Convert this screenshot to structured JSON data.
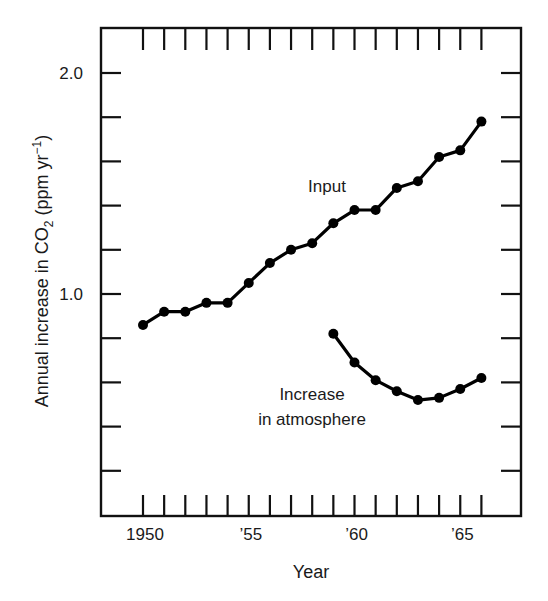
{
  "chart_data": {
    "type": "line",
    "title": "",
    "xlabel": "Year",
    "ylabel": "Annual increase in CO2 (ppm yr-1)",
    "ylabel_parts": {
      "main": "Annual increase in CO",
      "sub": "2",
      "mid": " (ppm yr",
      "sup": "−1",
      "end": ")"
    },
    "x": [
      1950,
      1951,
      1952,
      1953,
      1954,
      1955,
      1956,
      1957,
      1958,
      1959,
      1960,
      1961,
      1962,
      1963,
      1964,
      1965,
      1966
    ],
    "xlim": [
      1948.1,
      1968.0
    ],
    "ylim": [
      0.0,
      2.2
    ],
    "x_ticks": [
      1950,
      1951,
      1952,
      1953,
      1954,
      1955,
      1956,
      1957,
      1958,
      1959,
      1960,
      1961,
      1962,
      1963,
      1964,
      1965,
      1966
    ],
    "x_tick_labels": [
      {
        "value": 1950,
        "label": "1950"
      },
      {
        "value": 1955,
        "label": "’55"
      },
      {
        "value": 1960,
        "label": "’60"
      },
      {
        "value": 1965,
        "label": "’65"
      }
    ],
    "y_ticks": [
      0.2,
      0.4,
      0.6,
      0.8,
      1.0,
      1.2,
      1.4,
      1.6,
      1.8,
      2.0
    ],
    "y_tick_labels": [
      {
        "value": 1.0,
        "label": "1.0"
      },
      {
        "value": 2.0,
        "label": "2.0"
      }
    ],
    "grid": false,
    "legend": "none (inline annotations)",
    "series": [
      {
        "name": "Input",
        "x": [
          1950,
          1951,
          1952,
          1953,
          1954,
          1955,
          1956,
          1957,
          1958,
          1959,
          1960,
          1961,
          1962,
          1963,
          1964,
          1965,
          1966
        ],
        "values": [
          0.86,
          0.92,
          0.92,
          0.96,
          0.96,
          1.05,
          1.14,
          1.2,
          1.23,
          1.32,
          1.38,
          1.38,
          1.48,
          1.51,
          1.62,
          1.65,
          1.78
        ]
      },
      {
        "name": "Increase in atmosphere",
        "x": [
          1959,
          1960,
          1961,
          1962,
          1963,
          1964,
          1965,
          1966
        ],
        "values": [
          0.82,
          0.69,
          0.61,
          0.56,
          0.52,
          0.53,
          0.57,
          0.62
        ]
      }
    ],
    "annotations": [
      {
        "series": "Input",
        "lines": [
          "Input"
        ],
        "x": 327,
        "y": 192
      },
      {
        "series": "Increase in atmosphere",
        "lines": [
          "Increase",
          "in atmosphere"
        ],
        "x": 312,
        "y": 400
      }
    ]
  }
}
